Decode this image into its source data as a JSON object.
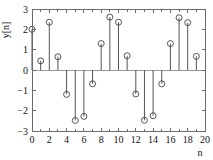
{
  "chart_data": {
    "type": "scatter",
    "plot_style": "stem",
    "title": "",
    "xlabel": "n",
    "ylabel": "y[n]",
    "xlim": [
      0,
      20
    ],
    "ylim": [
      -3,
      3
    ],
    "grid": false,
    "legend": null,
    "xticks": [
      0,
      2,
      4,
      6,
      8,
      10,
      12,
      14,
      16,
      18,
      20
    ],
    "xtick_labels": [
      "0",
      "2",
      "4",
      "6",
      "8",
      "10",
      "12",
      "14",
      "16",
      "18",
      "20"
    ],
    "xminor_ticks": [
      1,
      3,
      5,
      7,
      9,
      11,
      13,
      15,
      17,
      19
    ],
    "yticks": [
      -3,
      -2,
      -1,
      0,
      1,
      2,
      3
    ],
    "ytick_labels": [
      "−3",
      "−2",
      "−1",
      "0",
      "1",
      "2",
      "3"
    ],
    "zero_line": 0,
    "marker": "circle-open",
    "x": [
      0,
      1,
      2,
      3,
      4,
      5,
      6,
      7,
      8,
      9,
      10,
      11,
      12,
      13,
      14,
      15,
      16,
      17,
      18,
      19
    ],
    "values": [
      2.0,
      0.45,
      2.35,
      0.65,
      -1.2,
      -2.48,
      -2.28,
      -0.68,
      1.3,
      2.6,
      2.35,
      0.7,
      -1.18,
      -2.47,
      -2.25,
      -0.68,
      1.3,
      2.57,
      2.33,
      0.67
    ],
    "series": [
      {
        "name": "y[n]",
        "values": [
          2.0,
          0.45,
          2.35,
          0.65,
          -1.2,
          -2.48,
          -2.28,
          -0.68,
          1.3,
          2.6,
          2.35,
          0.7,
          -1.18,
          -2.47,
          -2.25,
          -0.68,
          1.3,
          2.57,
          2.33,
          0.67
        ]
      }
    ],
    "colors": {
      "stem": "#555555",
      "marker": "#444444",
      "axis": "#6a6a6a",
      "zero_line": "#9a9a9a",
      "background": "#ffffff",
      "text": "#111111"
    }
  },
  "geometry": {
    "plot_left": 32,
    "plot_right": 205,
    "plot_top": 9,
    "plot_bottom": 131,
    "tick_len": 3.5,
    "minor_tick_len": 2.5,
    "marker_radius": 3.0
  }
}
